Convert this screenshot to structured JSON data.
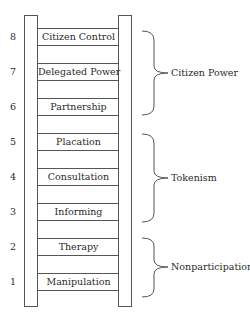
{
  "diagram": {
    "rungs": [
      {
        "level": "8",
        "label": "Citizen Control"
      },
      {
        "level": "7",
        "label": "Delegated Power"
      },
      {
        "level": "6",
        "label": "Partnership"
      },
      {
        "level": "5",
        "label": "Placation"
      },
      {
        "level": "4",
        "label": "Consultation"
      },
      {
        "level": "3",
        "label": "Informing"
      },
      {
        "level": "2",
        "label": "Therapy"
      },
      {
        "level": "1",
        "label": "Manipulation"
      }
    ],
    "groups": [
      {
        "label": "Citizen Power",
        "levels": [
          "8",
          "7",
          "6"
        ]
      },
      {
        "label": "Tokenism",
        "levels": [
          "5",
          "4",
          "3"
        ]
      },
      {
        "label": "Nonparticipation",
        "levels": [
          "2",
          "1"
        ]
      }
    ],
    "colors": {
      "line": "#555555",
      "text": "#2a2a2a",
      "background": "#ffffff"
    }
  }
}
